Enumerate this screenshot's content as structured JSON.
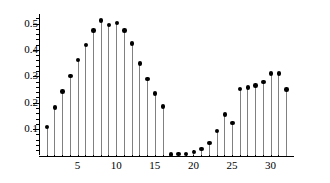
{
  "chart_data": {
    "type": "scatter",
    "plot_style": "stem",
    "title": "",
    "subtitle": "",
    "xlabel": "",
    "ylabel": "",
    "x": [
      1,
      2,
      3,
      4,
      5,
      6,
      7,
      8,
      9,
      10,
      11,
      12,
      13,
      14,
      15,
      16,
      17,
      18,
      19,
      20,
      21,
      22,
      23,
      24,
      25,
      26,
      27,
      28,
      29,
      30,
      31,
      32
    ],
    "values": [
      0.108,
      0.182,
      0.242,
      0.302,
      0.362,
      0.418,
      0.474,
      0.511,
      0.494,
      0.503,
      0.473,
      0.424,
      0.348,
      0.289,
      0.235,
      0.186,
      0.004,
      0.006,
      0.005,
      0.013,
      0.025,
      0.048,
      0.092,
      0.155,
      0.124,
      0.251,
      0.257,
      0.265,
      0.278,
      0.311,
      0.311,
      0.25
    ],
    "xlim": [
      0,
      33
    ],
    "ylim": [
      0,
      0.535
    ],
    "xticks": [
      5,
      10,
      15,
      20,
      25,
      30
    ],
    "xtick_labels": [
      "5",
      "10",
      "15",
      "20",
      "25",
      "30"
    ],
    "xticks_minor": [
      1,
      2,
      3,
      4,
      6,
      7,
      8,
      9,
      11,
      12,
      13,
      14,
      16,
      17,
      18,
      19,
      21,
      22,
      23,
      24,
      26,
      27,
      28,
      29,
      31,
      32
    ],
    "yticks": [
      0.1,
      0.2,
      0.3,
      0.4,
      0.5
    ],
    "ytick_labels": [
      "0.1",
      "0.2",
      "0.3",
      "0.4",
      "0.5"
    ],
    "yticks_minor": [
      0.02,
      0.04,
      0.06,
      0.08,
      0.12,
      0.14,
      0.16,
      0.18,
      0.22,
      0.24,
      0.26,
      0.28,
      0.32,
      0.34,
      0.36,
      0.38,
      0.42,
      0.44,
      0.46,
      0.48,
      0.52
    ],
    "grid": false,
    "legend": null,
    "legend_position": "none",
    "annotations": [],
    "marker_color": "#000000",
    "stem_color": "#808080",
    "axis_color": "#000000",
    "background_color": "#ffffff"
  }
}
